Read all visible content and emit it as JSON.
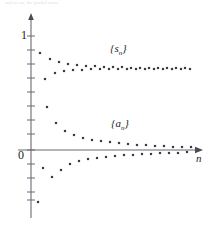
{
  "figure": {
    "top_text_strip": "and so on, the partial sums",
    "axis": {
      "y_label_one": "1",
      "origin_label": "0",
      "x_axis_label": "n"
    },
    "series_labels": {
      "partial_sums_open": "{",
      "partial_sums_var": "s",
      "partial_sums_sub": "n",
      "partial_sums_close": "}",
      "terms_open": "{",
      "terms_var": "a",
      "terms_sub": "n",
      "terms_close": "}"
    },
    "colors": {
      "axis": "#6b6b72",
      "point": "#3a3a42",
      "text": "#222222",
      "faint_text": "#d9d9dd",
      "background": "#ffffff"
    }
  },
  "chart_data": {
    "type": "scatter",
    "title": "",
    "xlabel": "n",
    "ylabel": "",
    "grid": false,
    "legend": "inline-annotations",
    "annotations": [
      {
        "text": "{s_n}",
        "x_px": 110,
        "y_px": 42
      },
      {
        "text": "{a_n}",
        "x_px": 111,
        "y_px": 117
      }
    ],
    "axis_pixels": {
      "y_axis_x": 31,
      "x_axis_y": 150,
      "y_value_1_at_px": 36,
      "y_value_0_at_px": 150,
      "px_per_unit_y": 114,
      "x_start_px": 31,
      "x_end_px": 196,
      "px_per_step_x": 4.6
    },
    "y_ticks": [
      36,
      50,
      64,
      78,
      92,
      106,
      120,
      134,
      150,
      164,
      178,
      192,
      200
    ],
    "series": [
      {
        "name": "{s_n}",
        "description": "partial sums of an alternating series, oscillating and converging to about 0.69",
        "points_px": [
          [
            40,
            53
          ],
          [
            45,
            79
          ],
          [
            50,
            59
          ],
          [
            55,
            73
          ],
          [
            59,
            62
          ],
          [
            64,
            71
          ],
          [
            68,
            64
          ],
          [
            73,
            70
          ],
          [
            77,
            65
          ],
          [
            82,
            70
          ],
          [
            86,
            66
          ],
          [
            91,
            69
          ],
          [
            95,
            66
          ],
          [
            100,
            69
          ],
          [
            104,
            67
          ],
          [
            109,
            69
          ],
          [
            113,
            67
          ],
          [
            118,
            69
          ],
          [
            122,
            67
          ],
          [
            127,
            69
          ],
          [
            131,
            68
          ],
          [
            136,
            69
          ],
          [
            140,
            68
          ],
          [
            145,
            69
          ],
          [
            149,
            68
          ],
          [
            154,
            69
          ],
          [
            158,
            68
          ],
          [
            163,
            69
          ],
          [
            167,
            68
          ],
          [
            172,
            69
          ],
          [
            176,
            68
          ],
          [
            181,
            69
          ],
          [
            185,
            68
          ],
          [
            190,
            69
          ]
        ]
      },
      {
        "name": "{a_n}",
        "description": "terms of the alternating series, alternating in sign and decreasing in magnitude to 0",
        "points_px": [
          [
            38,
            202
          ],
          [
            43,
            168
          ],
          [
            47,
            107
          ],
          [
            52,
            177
          ],
          [
            56,
            123
          ],
          [
            61,
            170
          ],
          [
            65,
            131
          ],
          [
            70,
            164
          ],
          [
            74,
            135
          ],
          [
            79,
            161
          ],
          [
            83,
            138
          ],
          [
            88,
            159
          ],
          [
            92,
            140
          ],
          [
            97,
            158
          ],
          [
            101,
            141
          ],
          [
            106,
            157
          ],
          [
            110,
            142
          ],
          [
            115,
            156
          ],
          [
            119,
            143
          ],
          [
            124,
            155
          ],
          [
            128,
            144
          ],
          [
            133,
            155
          ],
          [
            137,
            145
          ],
          [
            142,
            154
          ],
          [
            146,
            145
          ],
          [
            151,
            154
          ],
          [
            155,
            146
          ],
          [
            160,
            153
          ],
          [
            164,
            146
          ],
          [
            169,
            153
          ],
          [
            173,
            147
          ],
          [
            178,
            153
          ],
          [
            182,
            147
          ],
          [
            187,
            152
          ],
          [
            191,
            147
          ]
        ]
      }
    ]
  }
}
